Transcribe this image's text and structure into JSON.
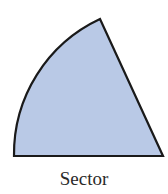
{
  "figure": {
    "shape": "sector",
    "fill_color": "#b9c9e6",
    "stroke_color": "#1a1a1a",
    "center": [
      163,
      156
    ],
    "radius": 149,
    "arc_start": [
      14,
      156
    ],
    "arc_end": [
      100,
      19
    ]
  },
  "caption": "Sector"
}
